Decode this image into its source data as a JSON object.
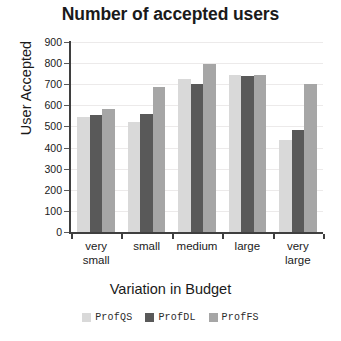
{
  "chart_data": {
    "type": "bar",
    "title": "Number of accepted users",
    "xlabel": "Variation in Budget",
    "ylabel": "User Accepted",
    "categories": [
      "very small",
      "small",
      "medium",
      "large",
      "very large"
    ],
    "category_lines": [
      [
        "very",
        "small"
      ],
      [
        "small"
      ],
      [
        "medium"
      ],
      [
        "large"
      ],
      [
        "very",
        "large"
      ]
    ],
    "series": [
      {
        "name": "ProfQS",
        "color": "#d9d9d9",
        "values": [
          545,
          520,
          725,
          745,
          435
        ]
      },
      {
        "name": "ProfDL",
        "color": "#595959",
        "values": [
          555,
          560,
          700,
          740,
          485
        ]
      },
      {
        "name": "ProfFS",
        "color": "#a6a6a6",
        "values": [
          585,
          685,
          795,
          745,
          700
        ]
      }
    ],
    "ylim": [
      0,
      900
    ],
    "ytick_step": 100,
    "yticks": [
      900,
      800,
      700,
      600,
      500,
      400,
      300,
      200,
      100,
      0
    ],
    "grid": true,
    "grid_axis": "y",
    "legend_position": "bottom"
  }
}
